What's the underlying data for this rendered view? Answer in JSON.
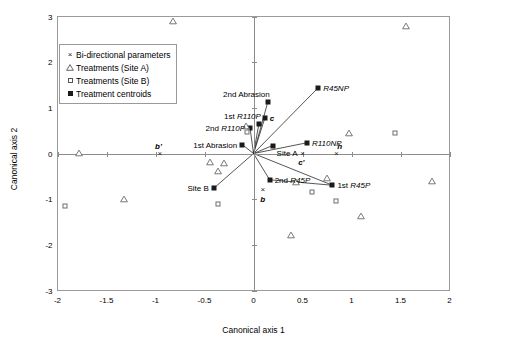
{
  "chart_data": {
    "type": "scatter",
    "title": "",
    "xlabel": "Canonical axis 1",
    "ylabel": "Canonical axis 2",
    "xlim": [
      -2,
      2
    ],
    "ylim": [
      -3,
      3
    ],
    "xticks": [
      "-2",
      "-1.5",
      "-1",
      "-0.5",
      "0",
      "0.5",
      "1",
      "1.5",
      "2"
    ],
    "xtick_values": [
      -2,
      -1.5,
      -1,
      -0.5,
      0,
      0.5,
      1,
      1.5,
      2
    ],
    "yticks": [
      "-3",
      "-2",
      "-1",
      "0",
      "1",
      "2",
      "3"
    ],
    "ytick_values": [
      -3,
      -2,
      -1,
      0,
      1,
      2,
      3
    ],
    "grid": false,
    "legend_position": "upper-left",
    "legend": [
      {
        "marker": "x",
        "label": "Bi-directional parameters"
      },
      {
        "marker": "open-triangle",
        "label": "Treatments (Site A)"
      },
      {
        "marker": "open-square",
        "label": "Treatments (Site B)"
      },
      {
        "marker": "filled-square",
        "label": "Treatment centroids"
      }
    ],
    "series": [
      {
        "name": "Bi-directional parameters",
        "marker": "x",
        "points": [
          {
            "label": "b'",
            "x": -0.955,
            "y": 0.0,
            "label_pos": "above-left",
            "style": "bold-italic"
          },
          {
            "label": "c'",
            "x": 0.5,
            "y": 0.0,
            "label_pos": "below-left",
            "style": "bold-italic"
          },
          {
            "label": "h",
            "x": 0.845,
            "y": 0.0,
            "label_pos": "above-right",
            "style": "bold-italic"
          },
          {
            "label": "b",
            "x": 0.095,
            "y": -0.8,
            "label_pos": "below",
            "style": "bold-italic"
          }
        ]
      },
      {
        "name": "Treatment centroids",
        "marker": "filled-square",
        "points": [
          {
            "label": "2nd Abrasion",
            "x": 0.145,
            "y": 1.12,
            "label_pos": "above-left"
          },
          {
            "label": "R45NP",
            "x": 0.66,
            "y": 1.44,
            "label_pos": "right",
            "style": "italic"
          },
          {
            "label": "1st R110P",
            "x": 0.055,
            "y": 0.645,
            "label_pos": "above-left",
            "style": "italic-prefix"
          },
          {
            "label": "2nd R110P",
            "x": -0.035,
            "y": 0.555,
            "label_pos": "left",
            "style": "italic-prefix"
          },
          {
            "label": "1st Abrasion",
            "x": -0.115,
            "y": 0.195,
            "label_pos": "left"
          },
          {
            "label": "c",
            "x": 0.115,
            "y": 0.77,
            "label_pos": "right",
            "style": "bold-italic"
          },
          {
            "label": "Site A",
            "x": 0.195,
            "y": 0.175,
            "label_pos": "below-right"
          },
          {
            "label": "R110NP",
            "x": 0.545,
            "y": 0.235,
            "label_pos": "right",
            "style": "italic"
          },
          {
            "label": "Site B",
            "x": -0.405,
            "y": -0.76,
            "label_pos": "left"
          },
          {
            "label": "2nd R45P",
            "x": 0.165,
            "y": -0.575,
            "label_pos": "right",
            "style": "italic-prefix"
          },
          {
            "label": "1st R45P",
            "x": 0.805,
            "y": -0.695,
            "label_pos": "right",
            "style": "italic-prefix"
          }
        ]
      },
      {
        "name": "Treatments (Site A)",
        "marker": "open-triangle",
        "points": [
          {
            "x": -0.82,
            "y": 2.9
          },
          {
            "x": 1.56,
            "y": 2.8
          },
          {
            "x": -0.075,
            "y": 0.605
          },
          {
            "x": 0.97,
            "y": 0.455
          },
          {
            "x": -1.78,
            "y": 0.02
          },
          {
            "x": -0.44,
            "y": -0.195
          },
          {
            "x": -0.305,
            "y": -0.2
          },
          {
            "x": -0.36,
            "y": -0.375
          },
          {
            "x": -1.32,
            "y": -0.99
          },
          {
            "x": 0.435,
            "y": -0.635
          },
          {
            "x": 0.755,
            "y": -0.535
          },
          {
            "x": 1.82,
            "y": -0.595
          },
          {
            "x": 1.095,
            "y": -1.36
          },
          {
            "x": 0.385,
            "y": -1.78
          }
        ]
      },
      {
        "name": "Treatments (Site B)",
        "marker": "open-square",
        "points": [
          {
            "x": -0.065,
            "y": 0.475
          },
          {
            "x": 1.44,
            "y": 0.44
          },
          {
            "x": -1.925,
            "y": -1.155
          },
          {
            "x": -0.36,
            "y": -1.1
          },
          {
            "x": 0.6,
            "y": -0.835
          },
          {
            "x": 0.845,
            "y": -1.05
          }
        ]
      }
    ],
    "vectors": [
      {
        "from": [
          0,
          0
        ],
        "to": [
          0.145,
          1.12
        ],
        "name": "2nd-abrasion-vector"
      },
      {
        "from": [
          0,
          0
        ],
        "to": [
          0.66,
          1.44
        ],
        "name": "r45np-vector"
      },
      {
        "from": [
          0,
          0
        ],
        "to": [
          0.055,
          0.645
        ],
        "name": "1st-r110p-vector"
      },
      {
        "from": [
          0,
          0
        ],
        "to": [
          -0.035,
          0.555
        ],
        "name": "2nd-r110p-vector"
      },
      {
        "from": [
          0,
          0
        ],
        "to": [
          0.115,
          0.77
        ],
        "name": "c-vector"
      },
      {
        "from": [
          0,
          0
        ],
        "to": [
          -0.115,
          0.195
        ],
        "name": "1st-abrasion-vector"
      },
      {
        "from": [
          0,
          0
        ],
        "to": [
          0.545,
          0.235
        ],
        "name": "r110np-vector"
      },
      {
        "from": [
          0,
          0
        ],
        "to": [
          0.195,
          0.175
        ],
        "name": "site-a-vector"
      },
      {
        "from": [
          0,
          0
        ],
        "to": [
          -0.405,
          -0.76
        ],
        "name": "site-b-vector"
      },
      {
        "from": [
          0,
          0
        ],
        "to": [
          0.165,
          -0.575
        ],
        "name": "2nd-r45p-vector"
      },
      {
        "from": [
          0,
          0
        ],
        "to": [
          0.805,
          -0.695
        ],
        "name": "1st-r45p-vector"
      },
      {
        "from": [
          0.165,
          -0.575
        ],
        "to": [
          0.805,
          -0.695
        ],
        "name": "r45p-connector"
      }
    ]
  }
}
